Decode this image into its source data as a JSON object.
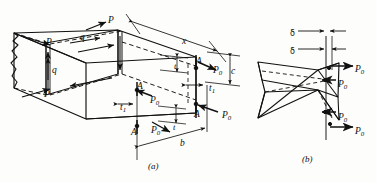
{
  "figure": {
    "kind": "engineering-diagram",
    "stroke_color": "#111111",
    "background_color": "#fdfdfb",
    "panels": [
      {
        "id": "a",
        "caption": "(a)",
        "caption_x": 148,
        "caption_y": 162
      },
      {
        "id": "b",
        "caption": "(b)",
        "caption_x": 302,
        "caption_y": 155
      }
    ]
  },
  "labels_panel_a": [
    {
      "name": "load-P-top-right",
      "text": "P",
      "x": 108,
      "y": 16,
      "size": "sz9"
    },
    {
      "name": "load-P-left-upper",
      "text": "P",
      "x": 46,
      "y": 38,
      "size": "sz9"
    },
    {
      "name": "load-P-left-lower",
      "text": "P",
      "x": 44,
      "y": 90,
      "size": "sz9"
    },
    {
      "name": "shear-flow-q-top",
      "text": "q",
      "x": 80,
      "y": 33,
      "size": "sz9"
    },
    {
      "name": "shear-flow-q-side",
      "text": "q",
      "x": 52,
      "y": 66,
      "size": "sz9"
    },
    {
      "name": "length-x",
      "text": "x",
      "x": 182,
      "y": 37,
      "size": "sz9"
    },
    {
      "name": "section-A-top-right",
      "text": "A",
      "x": 196,
      "y": 57,
      "size": "sz9"
    },
    {
      "name": "section-A-mid-left",
      "text": "A",
      "x": 137,
      "y": 82,
      "size": "sz9"
    },
    {
      "name": "section-A-mid-right",
      "text": "A",
      "x": 194,
      "y": 110,
      "size": "sz9"
    },
    {
      "name": "section-A-bottom",
      "text": "A",
      "x": 131,
      "y": 128,
      "size": "sz9"
    },
    {
      "name": "depth-c",
      "text": "c",
      "x": 231,
      "y": 67,
      "size": "sz9"
    },
    {
      "name": "width-b",
      "text": "b",
      "x": 180,
      "y": 139,
      "size": "sz9"
    },
    {
      "name": "thickness-t-upper",
      "text": "t",
      "x": 174,
      "y": 62,
      "size": "sz8"
    },
    {
      "name": "thickness-t-lower",
      "text": "t",
      "x": 173,
      "y": 123,
      "size": "sz8"
    }
  ],
  "subscript_labels_panel_a": [
    {
      "name": "wall-thickness-t1-right",
      "base": "t",
      "sub": "1",
      "x": 209,
      "y": 84
    },
    {
      "name": "wall-thickness-t1-left",
      "base": "t",
      "sub": "1",
      "x": 120,
      "y": 103
    },
    {
      "name": "force-P0-upper-right",
      "base": "P",
      "sub": "0",
      "x": 213,
      "y": 66
    },
    {
      "name": "force-P0-mid-left",
      "base": "P",
      "sub": "0",
      "x": 150,
      "y": 96
    },
    {
      "name": "force-P0-lower-right",
      "base": "P",
      "sub": "0",
      "x": 222,
      "y": 111
    },
    {
      "name": "force-P0-bottom-left",
      "base": "P",
      "sub": "0",
      "x": 151,
      "y": 126
    }
  ],
  "labels_panel_b": [
    {
      "name": "deflection-delta-upper",
      "text": "δ",
      "x": 290,
      "y": 30
    },
    {
      "name": "deflection-delta-lower",
      "text": "δ",
      "x": 290,
      "y": 48
    }
  ],
  "subscript_labels_panel_b": [
    {
      "name": "force-P0-b-outer-top",
      "base": "P",
      "sub": "0",
      "x": 355,
      "y": 65
    },
    {
      "name": "force-P0-b-inner-top",
      "base": "P",
      "sub": "0",
      "x": 338,
      "y": 80
    },
    {
      "name": "force-P0-b-inner-bot",
      "base": "P",
      "sub": "0",
      "x": 338,
      "y": 113
    },
    {
      "name": "force-P0-b-outer-bot",
      "base": "P",
      "sub": "0",
      "x": 355,
      "y": 127
    }
  ]
}
